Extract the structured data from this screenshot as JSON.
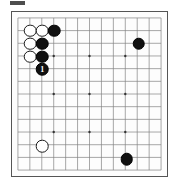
{
  "diagram": {
    "kind": "go-board-diagram",
    "board_size": 13,
    "grid": {
      "columns": 13,
      "rows": 13,
      "line_color": "#808080",
      "border_color": "#555555",
      "background_color": "#fdfdfd"
    },
    "star_points": [
      {
        "col": 3,
        "row": 3
      },
      {
        "col": 6,
        "row": 3
      },
      {
        "col": 9,
        "row": 3
      },
      {
        "col": 3,
        "row": 6
      },
      {
        "col": 6,
        "row": 6
      },
      {
        "col": 9,
        "row": 6
      },
      {
        "col": 3,
        "row": 9
      },
      {
        "col": 6,
        "row": 9
      },
      {
        "col": 9,
        "row": 9
      }
    ],
    "colors": {
      "black_stone": "#111111",
      "white_stone": "#ffffff",
      "stone_outline": "#1a1a1a",
      "marker_text": "#ffffff"
    },
    "stones": [
      {
        "color": "white",
        "col": 1,
        "row": 1,
        "label": ""
      },
      {
        "color": "white",
        "col": 2,
        "row": 1,
        "label": ""
      },
      {
        "color": "black",
        "col": 3,
        "row": 1,
        "label": ""
      },
      {
        "color": "white",
        "col": 1,
        "row": 2,
        "label": ""
      },
      {
        "color": "black",
        "col": 2,
        "row": 2,
        "label": ""
      },
      {
        "color": "white",
        "col": 1,
        "row": 3,
        "label": ""
      },
      {
        "color": "black",
        "col": 2,
        "row": 3,
        "label": ""
      },
      {
        "color": "black",
        "col": 2,
        "row": 4,
        "label": "1"
      },
      {
        "color": "black",
        "col": 10,
        "row": 2,
        "label": ""
      },
      {
        "color": "white",
        "col": 2,
        "row": 10,
        "label": ""
      },
      {
        "color": "black",
        "col": 9,
        "row": 11,
        "label": ""
      }
    ],
    "counts": {
      "black_stones": "6",
      "white_stones": "5",
      "total_stones": "11"
    }
  }
}
